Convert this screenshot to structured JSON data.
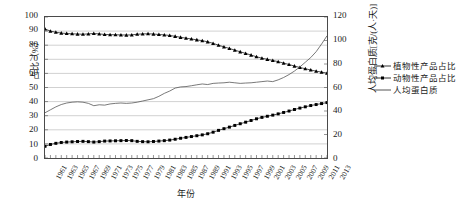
{
  "chart_data": {
    "type": "line",
    "title": "",
    "xlabel": "年份",
    "ylabel": "占比（%）",
    "y2label": "人均蛋白质[克/(人·天)]",
    "xlim": [
      1961,
      2013
    ],
    "ylim": [
      0,
      100
    ],
    "y2lim": [
      0,
      120
    ],
    "grid": true,
    "legend_position": "right",
    "x": [
      1961,
      1962,
      1963,
      1964,
      1965,
      1966,
      1967,
      1968,
      1969,
      1970,
      1971,
      1972,
      1973,
      1974,
      1975,
      1976,
      1977,
      1978,
      1979,
      1980,
      1981,
      1982,
      1983,
      1984,
      1985,
      1986,
      1987,
      1988,
      1989,
      1990,
      1991,
      1992,
      1993,
      1994,
      1995,
      1996,
      1997,
      1998,
      1999,
      2000,
      2001,
      2002,
      2003,
      2004,
      2005,
      2006,
      2007,
      2008,
      2009,
      2010,
      2011,
      2012,
      2013
    ],
    "x_tick_labels": [
      "1961",
      "1963",
      "1965",
      "1967",
      "1969",
      "1971",
      "1973",
      "1975",
      "1977",
      "1979",
      "1981",
      "1983",
      "1985",
      "1987",
      "1989",
      "1991",
      "1993",
      "1995",
      "1997",
      "1999",
      "2001",
      "2003",
      "2005",
      "2007",
      "2009",
      "2011",
      "2013"
    ],
    "y_tick_labels": [
      "0",
      "10",
      "20",
      "30",
      "40",
      "50",
      "60",
      "70",
      "80",
      "90",
      "100"
    ],
    "y2_tick_labels": [
      "0",
      "20",
      "40",
      "60",
      "80",
      "100",
      "120"
    ],
    "series": [
      {
        "name": "植物性产品占比",
        "axis": "left",
        "marker": "triangle",
        "color": "#000000",
        "values": [
          91.5,
          90.0,
          89.2,
          88.6,
          88.3,
          88.1,
          87.9,
          87.8,
          88.0,
          88.3,
          88.0,
          87.6,
          87.5,
          87.4,
          87.3,
          87.2,
          87.3,
          87.8,
          88.0,
          88.1,
          87.9,
          87.6,
          87.3,
          86.9,
          86.3,
          85.6,
          85.0,
          84.4,
          83.8,
          83.2,
          82.4,
          81.3,
          80.0,
          78.8,
          77.7,
          76.5,
          75.3,
          74.2,
          73.0,
          71.8,
          70.8,
          70.0,
          69.2,
          68.3,
          67.3,
          66.3,
          65.2,
          64.2,
          63.3,
          62.4,
          61.6,
          60.9,
          60.2
        ]
      },
      {
        "name": "动物性产品占比",
        "axis": "left",
        "marker": "square",
        "color": "#000000",
        "values": [
          8.3,
          9.6,
          10.4,
          11.0,
          11.3,
          11.5,
          11.7,
          11.8,
          11.6,
          11.3,
          11.6,
          12.0,
          12.1,
          12.2,
          12.3,
          12.4,
          12.3,
          11.8,
          11.6,
          11.5,
          11.7,
          12.0,
          12.3,
          12.7,
          13.3,
          14.0,
          14.6,
          15.2,
          15.8,
          16.4,
          17.2,
          18.3,
          19.6,
          20.8,
          21.9,
          23.1,
          24.3,
          25.4,
          26.6,
          27.8,
          28.8,
          29.6,
          30.4,
          31.3,
          32.3,
          33.3,
          34.4,
          35.4,
          36.3,
          37.2,
          37.9,
          38.6,
          39.3
        ]
      },
      {
        "name": "人均蛋白质",
        "axis": "right",
        "marker": "none",
        "color": "#555555",
        "values": [
          38.5,
          41.0,
          43.5,
          45.5,
          46.8,
          47.5,
          47.8,
          47.5,
          46.5,
          44.5,
          45.3,
          45.0,
          46.0,
          46.5,
          46.8,
          46.5,
          46.8,
          47.5,
          48.5,
          49.5,
          50.5,
          52.5,
          55.0,
          57.0,
          59.5,
          60.5,
          60.8,
          61.5,
          62.3,
          63.0,
          62.5,
          63.5,
          63.8,
          64.0,
          64.5,
          64.0,
          63.5,
          63.8,
          64.0,
          64.5,
          65.0,
          65.5,
          65.0,
          66.5,
          68.5,
          71.0,
          74.0,
          77.5,
          81.5,
          85.5,
          90.5,
          97.0,
          104.0
        ]
      }
    ]
  }
}
